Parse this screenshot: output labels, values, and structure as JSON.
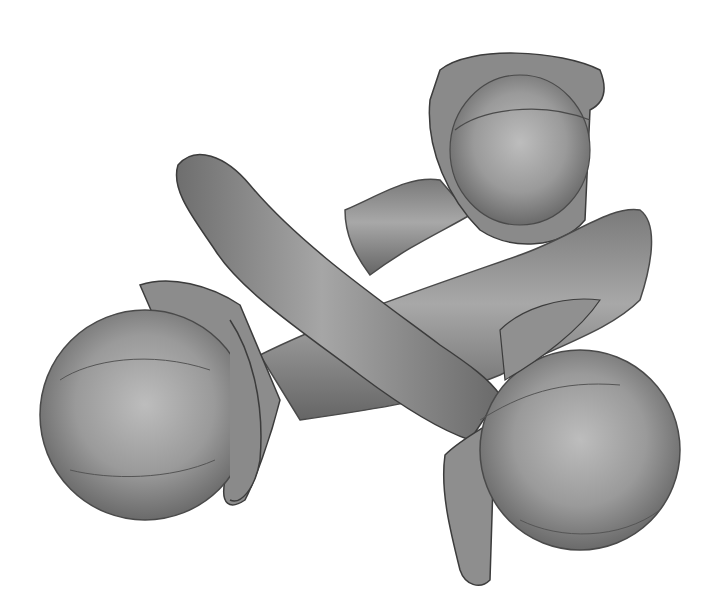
{
  "image": {
    "subject": "Illustration of three cloves",
    "style": "grayscale shaded drawing",
    "background_color": "#ffffff",
    "palette": {
      "light": "#b8b8b8",
      "mid": "#8e8e8e",
      "dark": "#5e5e5e",
      "outline": "#3c3c3c"
    },
    "objects": [
      {
        "name": "clove-top-right",
        "head_center": [
          515,
          140
        ],
        "head_radius": 75
      },
      {
        "name": "clove-diagonal-center",
        "stem_from": [
          195,
          175
        ],
        "stem_to": [
          480,
          420
        ]
      },
      {
        "name": "clove-bottom-left-right",
        "left_head_center": [
          140,
          420
        ],
        "right_head_center": [
          575,
          445
        ]
      }
    ]
  }
}
